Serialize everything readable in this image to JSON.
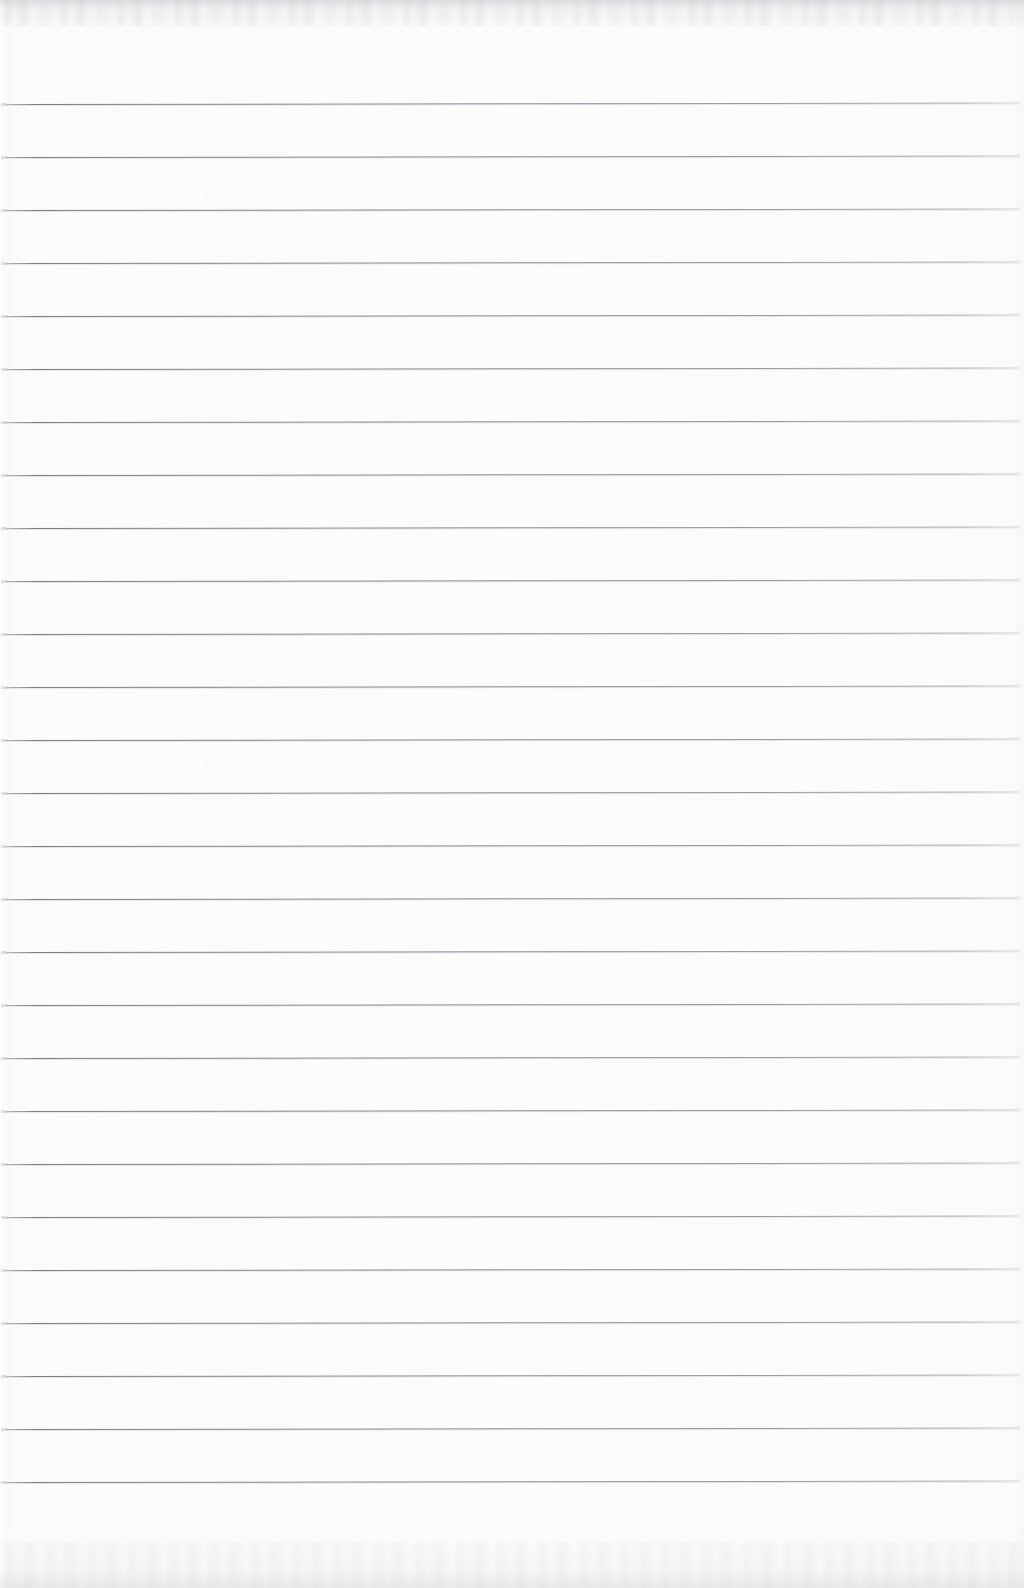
{
  "document": {
    "kind": "scanned-lined-notebook-page",
    "title": "Blank ruled paper scan",
    "orientation": "portrait",
    "page_width_px": 1024,
    "page_height_px": 1588,
    "content_text": "",
    "has_handwriting": false,
    "has_printed_text": false
  },
  "colors": {
    "paper": "#fdfdfd",
    "paper_edge": "#f4f5f6",
    "rule_line": "#767a7f",
    "rule_line_highlight": "#d2d5d9",
    "page_shadow": "#a8acb0"
  },
  "ruling": {
    "style": "wide-ruled horizontal lines",
    "line_count": 27,
    "first_line_y": 104,
    "line_spacing_px": 53.0,
    "line_left_x": 6,
    "line_right_x": 1014,
    "line_thickness_px": 1,
    "slant_deg": -0.08,
    "has_left_margin_rule": false,
    "has_right_margin_rule": false,
    "has_header_rule": false
  },
  "regions": {
    "top_margin_label": "top margin",
    "bottom_margin_label": "bottom margin",
    "writing_area_label": "writing area"
  },
  "scan_artifacts": {
    "top_edge_band": true,
    "bottom_edge_band": true,
    "left_page_curl": true,
    "paper_grain": true
  }
}
